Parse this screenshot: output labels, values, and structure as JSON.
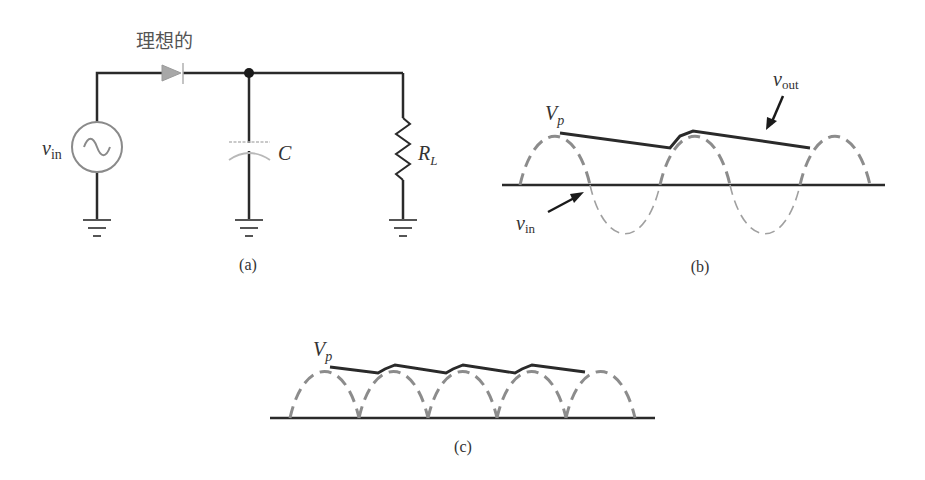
{
  "circuit": {
    "diode_label": "理想的",
    "source_label_main": "v",
    "source_label_sub": "in",
    "capacitor_label": "C",
    "resistor_label_main": "R",
    "resistor_label_sub": "L",
    "caption": "(a)"
  },
  "waveform_b": {
    "vp_main": "V",
    "vp_sub": "p",
    "vout_main": "v",
    "vout_sub": "out",
    "vin_main": "v",
    "vin_sub": "in",
    "caption": "(b)"
  },
  "waveform_c": {
    "vp_main": "V",
    "vp_sub": "p",
    "caption": "(c)"
  },
  "colors": {
    "wire": "#2a2a2a",
    "dashed": "#8c8c8c",
    "light": "#b5b5b5"
  }
}
